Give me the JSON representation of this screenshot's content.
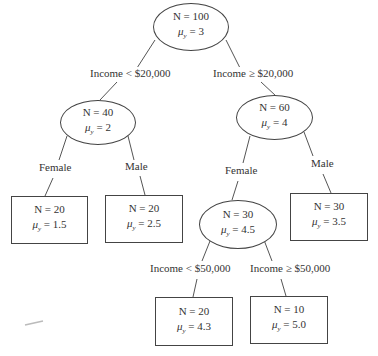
{
  "diagram": {
    "type": "regression-tree",
    "nodes": {
      "root": {
        "shape": "ellipse",
        "n": "N = 100",
        "mu_value": "= 3"
      },
      "low_income": {
        "shape": "ellipse",
        "n": "N = 40",
        "mu_value": "= 2"
      },
      "high_income": {
        "shape": "ellipse",
        "n": "N = 60",
        "mu_value": "= 4"
      },
      "low_female": {
        "shape": "box",
        "n": "N = 20",
        "mu_value": "= 1.5"
      },
      "low_male": {
        "shape": "box",
        "n": "N = 20",
        "mu_value": "= 2.5"
      },
      "high_female": {
        "shape": "ellipse",
        "n": "N = 30",
        "mu_value": "= 4.5"
      },
      "high_male": {
        "shape": "box",
        "n": "N = 30",
        "mu_value": "= 3.5"
      },
      "hf_low": {
        "shape": "box",
        "n": "N = 20",
        "mu_value": "= 4.3"
      },
      "hf_high": {
        "shape": "box",
        "n": "N = 10",
        "mu_value": "= 5.0"
      }
    },
    "mu_symbol": "μ",
    "mu_subscript": "y",
    "edges": {
      "root_left": "Income < $20,000",
      "root_right": "Income ≥ $20,000",
      "low_left": "Female",
      "low_right": "Male",
      "high_left": "Female",
      "high_right": "Male",
      "hf_left": "Income < $50,000",
      "hf_right": "Income ≥ $50,000"
    },
    "colors": {
      "stroke": "#444444",
      "text": "#333333",
      "background": "#ffffff"
    }
  }
}
